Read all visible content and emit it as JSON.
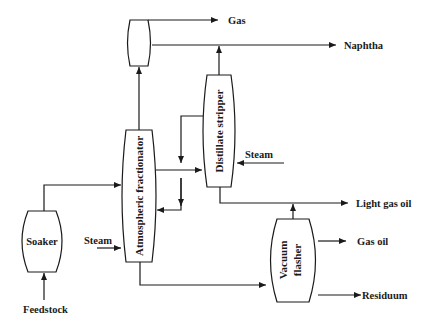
{
  "diagram": {
    "type": "process-flow",
    "vessels": {
      "top_drum": "",
      "atmospheric_fractionator": "Atmospheric fractionator",
      "distillate_stripper": "Distillate stripper",
      "soaker": "Soaker",
      "vacuum_flasher_line1": "Vacuum",
      "vacuum_flasher_line2": "flasher"
    },
    "streams": {
      "gas": "Gas",
      "naphtha": "Naphtha",
      "steam_stripper": "Steam",
      "light_gas_oil": "Light gas oil",
      "gas_oil": "Gas oil",
      "residuum": "Residuum",
      "steam_fractionator": "Steam",
      "feedstock": "Feedstock"
    },
    "connections": [
      {
        "from": "Feedstock",
        "to": "Soaker"
      },
      {
        "from": "Soaker",
        "to": "Atmospheric fractionator"
      },
      {
        "from": "Steam",
        "to": "Atmospheric fractionator"
      },
      {
        "from": "Atmospheric fractionator",
        "to": "Top drum"
      },
      {
        "from": "Top drum",
        "to": "Gas"
      },
      {
        "from": "Top drum",
        "to": "Naphtha"
      },
      {
        "from": "Distillate stripper",
        "to": "Naphtha"
      },
      {
        "from": "Atmospheric fractionator",
        "to": "Distillate stripper"
      },
      {
        "from": "Distillate stripper",
        "to": "Atmospheric fractionator"
      },
      {
        "from": "Steam",
        "to": "Distillate stripper"
      },
      {
        "from": "Distillate stripper",
        "to": "Light gas oil"
      },
      {
        "from": "Vacuum flasher",
        "to": "Light gas oil"
      },
      {
        "from": "Atmospheric fractionator",
        "to": "Vacuum flasher"
      },
      {
        "from": "Vacuum flasher",
        "to": "Gas oil"
      },
      {
        "from": "Vacuum flasher",
        "to": "Residuum"
      }
    ]
  }
}
